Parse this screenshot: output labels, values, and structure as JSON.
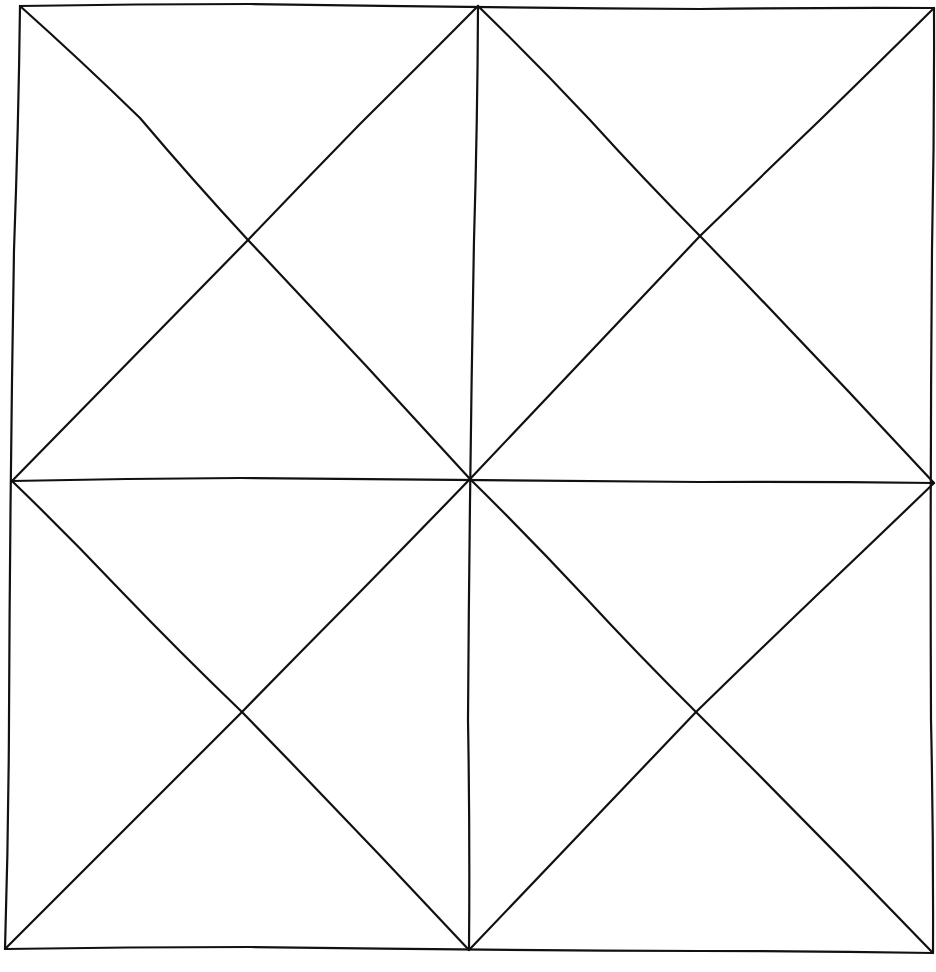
{
  "diagram": {
    "style": {
      "stroke_color": "#111111",
      "background_color": "#ffffff",
      "stroke_width": 2.2
    },
    "vertices": {
      "top_left": [
        20,
        6
      ],
      "top_mid": [
        478,
        6
      ],
      "top_right": [
        934,
        8
      ],
      "mid_left": [
        12,
        481
      ],
      "center": [
        470,
        479
      ],
      "mid_right": [
        934,
        483
      ],
      "bottom_left": [
        5,
        949
      ],
      "bottom_mid": [
        469,
        950
      ],
      "bottom_right": [
        933,
        953
      ]
    },
    "lines": [
      {
        "name": "outer-top-edge",
        "from": "top_left",
        "to": "top_right",
        "wobble": [
          [
            250,
            4
          ],
          [
            700,
            9
          ]
        ]
      },
      {
        "name": "outer-right-edge",
        "from": "top_right",
        "to": "bottom_right",
        "wobble": [
          [
            932,
            250
          ],
          [
            931,
            720
          ]
        ]
      },
      {
        "name": "outer-bottom-edge",
        "from": "bottom_right",
        "to": "bottom_left",
        "wobble": [
          [
            700,
            951
          ],
          [
            250,
            947
          ]
        ]
      },
      {
        "name": "outer-left-edge",
        "from": "bottom_left",
        "to": "top_left",
        "wobble": [
          [
            9,
            720
          ],
          [
            14,
            250
          ]
        ]
      },
      {
        "name": "vertical-midline",
        "from": "top_mid",
        "to": "bottom_mid",
        "wobble": [
          [
            474,
            240
          ],
          [
            468,
            720
          ]
        ]
      },
      {
        "name": "horizontal-midline",
        "from": "mid_left",
        "to": "mid_right",
        "wobble": [
          [
            240,
            478
          ],
          [
            700,
            482
          ]
        ]
      },
      {
        "name": "diag-tl-quadrant-a",
        "from": "top_left",
        "to": "center",
        "wobble": [
          [
            140,
            118
          ],
          [
            248,
            240
          ]
        ]
      },
      {
        "name": "diag-tl-quadrant-b",
        "from": "top_mid",
        "to": "mid_left",
        "wobble": [
          [
            360,
            124
          ],
          [
            248,
            240
          ]
        ]
      },
      {
        "name": "diag-tr-quadrant-a",
        "from": "top_mid",
        "to": "mid_right",
        "wobble": [
          [
            590,
            120
          ],
          [
            700,
            236
          ]
        ]
      },
      {
        "name": "diag-tr-quadrant-b",
        "from": "top_right",
        "to": "center",
        "wobble": [
          [
            820,
            120
          ],
          [
            700,
            236
          ]
        ]
      },
      {
        "name": "diag-bl-quadrant-a",
        "from": "mid_left",
        "to": "bottom_mid",
        "wobble": [
          [
            120,
            590
          ],
          [
            242,
            712
          ]
        ]
      },
      {
        "name": "diag-bl-quadrant-b",
        "from": "center",
        "to": "bottom_left",
        "wobble": [
          [
            358,
            594
          ],
          [
            242,
            712
          ]
        ]
      },
      {
        "name": "diag-br-quadrant-a",
        "from": "center",
        "to": "bottom_right",
        "wobble": [
          [
            584,
            596
          ],
          [
            696,
            712
          ]
        ]
      },
      {
        "name": "diag-br-quadrant-b",
        "from": "mid_right",
        "to": "bottom_mid",
        "wobble": [
          [
            816,
            596
          ],
          [
            696,
            712
          ]
        ]
      }
    ],
    "quadrant_centers": {
      "top_left": [
        248,
        240
      ],
      "top_right": [
        700,
        236
      ],
      "bottom_left": [
        242,
        712
      ],
      "bottom_right": [
        696,
        712
      ]
    }
  }
}
